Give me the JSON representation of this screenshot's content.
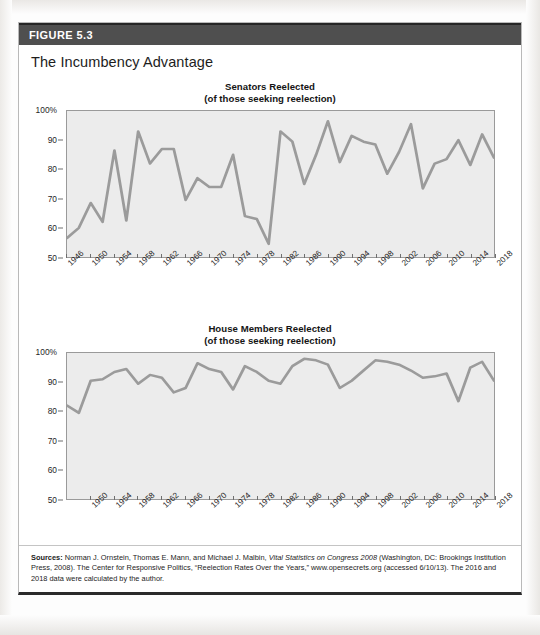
{
  "figure": {
    "band_label": "FIGURE 5.3",
    "title": "The Incumbency Advantage",
    "source_prefix": "Sources:",
    "source_text_1": " Norman J. Ornstein, Thomas E. Mann, and Michael J. Malbin, ",
    "source_italic": "Vital Statistics on Congress 2008",
    "source_text_2": " (Washington, DC: Brookings Institution Press, 2008). The Center for Responsive Politics, “Reelection Rates Over the Years,” www.opensecrets.org (accessed 6/10/13). The 2016 and 2018 data were calculated by the author."
  },
  "colors": {
    "band": "#4f4f4f",
    "plot_fill": "#ececec",
    "plot_border": "#9a9a9a",
    "line": "#9b9b9b",
    "text": "#1d1d1d"
  },
  "chart_data": [
    {
      "type": "line",
      "id": "senators-reelected",
      "title": "Senators Reelected",
      "subtitle": "(of those seeking reelection)",
      "xlabel": "",
      "ylabel": "",
      "ylim": [
        50,
        100
      ],
      "yticks": [
        50,
        60,
        70,
        80,
        90,
        100
      ],
      "ytick_labels": [
        "50",
        "60",
        "70",
        "80",
        "90",
        "100%"
      ],
      "grid": false,
      "legend": "none",
      "x": [
        1946,
        1948,
        1950,
        1952,
        1954,
        1956,
        1958,
        1960,
        1962,
        1964,
        1966,
        1968,
        1970,
        1972,
        1974,
        1976,
        1978,
        1980,
        1982,
        1984,
        1986,
        1988,
        1990,
        1992,
        1994,
        1996,
        1998,
        2000,
        2002,
        2004,
        2006,
        2008,
        2010,
        2012,
        2014,
        2016,
        2018
      ],
      "xtick_labels": [
        "1946",
        "1950",
        "1954",
        "1958",
        "1962",
        "1966",
        "1970",
        "1974",
        "1978",
        "1982",
        "1986",
        "1990",
        "1994",
        "1998",
        "2002",
        "2006",
        "2010",
        "2014",
        "2018"
      ],
      "values": [
        56.5,
        60,
        68.5,
        62,
        86.5,
        62.5,
        93,
        82,
        87,
        87,
        69.5,
        77,
        74,
        74,
        85,
        64,
        63,
        54.5,
        93,
        89.5,
        75,
        85,
        96.5,
        82.5,
        91.5,
        89.5,
        88.5,
        78.5,
        86,
        95.5,
        73.5,
        82,
        83.5,
        90,
        81.5,
        92,
        84
      ]
    },
    {
      "type": "line",
      "id": "house-members-reelected",
      "title": "House Members Reelected",
      "subtitle": "(of those seeking reelection)",
      "xlabel": "",
      "ylabel": "",
      "ylim": [
        50,
        100
      ],
      "yticks": [
        50,
        60,
        70,
        80,
        90,
        100
      ],
      "ytick_labels": [
        "50",
        "60",
        "70",
        "80",
        "90",
        "100%"
      ],
      "grid": false,
      "legend": "none",
      "x": [
        1946,
        1948,
        1950,
        1952,
        1954,
        1956,
        1958,
        1960,
        1962,
        1964,
        1966,
        1968,
        1970,
        1972,
        1974,
        1976,
        1978,
        1980,
        1982,
        1984,
        1986,
        1988,
        1990,
        1992,
        1994,
        1996,
        1998,
        2000,
        2002,
        2004,
        2006,
        2008,
        2010,
        2012,
        2014,
        2016,
        2018
      ],
      "xtick_labels": [
        "1950",
        "1954",
        "1958",
        "1962",
        "1966",
        "1970",
        "1974",
        "1978",
        "1982",
        "1986",
        "1990",
        "1994",
        "1998",
        "2002",
        "2006",
        "2010",
        "2014",
        "2018"
      ],
      "values": [
        82,
        79.5,
        90.5,
        91,
        93.5,
        94.5,
        89.5,
        92.5,
        91.5,
        86.5,
        88,
        96.5,
        94.5,
        93.5,
        87.5,
        95.5,
        93.5,
        90.5,
        89.5,
        95.5,
        98,
        97.5,
        96,
        88,
        90.5,
        94,
        97.5,
        97,
        96,
        94,
        91.5,
        92,
        93,
        83.5,
        95,
        97,
        90.5
      ]
    }
  ]
}
